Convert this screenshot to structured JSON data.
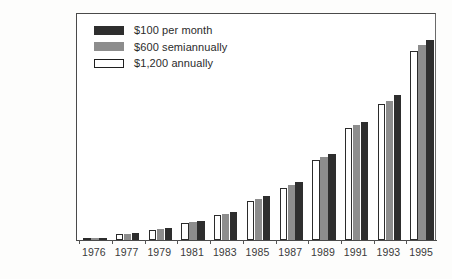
{
  "chart_data": {
    "type": "bar",
    "title": "",
    "subtitle": "",
    "xlabel": "",
    "ylabel": "",
    "grid": false,
    "legend_position": "top-left",
    "ylim": [
      0,
      150000
    ],
    "yticks": [
      0,
      50000,
      100000,
      150000
    ],
    "ytick_labels": [
      "0",
      "50,000",
      "100,000",
      "$150,000"
    ],
    "categories": [
      "1976",
      "1977",
      "1979",
      "1981",
      "1983",
      "1985",
      "1987",
      "1989",
      "1991",
      "1993",
      "1995"
    ],
    "series": [
      {
        "name": "$1,200 annually",
        "color": "#ffffff",
        "edge_color": "#2b2b2b",
        "values": [
          1200,
          4200,
          7000,
          11500,
          17000,
          26500,
          35000,
          54000,
          76000,
          92000,
          128000
        ]
      },
      {
        "name": "$600 semiannually",
        "color": "#8d8d8d",
        "edge_color": "#8d8d8d",
        "values": [
          1300,
          4400,
          7400,
          12000,
          17800,
          27500,
          37000,
          56000,
          78000,
          94000,
          132000
        ]
      },
      {
        "name": "$100 per month",
        "color": "#2e2e2e",
        "edge_color": "#2e2e2e",
        "values": [
          1400,
          4600,
          7800,
          12600,
          18600,
          29500,
          39000,
          58000,
          80000,
          98000,
          135000
        ]
      }
    ]
  },
  "legend": {
    "items": [
      {
        "label": "$100 per month",
        "swatch": "monthly"
      },
      {
        "label": "$600 semiannually",
        "swatch": "semi"
      },
      {
        "label": "$1,200 annually",
        "swatch": "annually"
      }
    ]
  }
}
